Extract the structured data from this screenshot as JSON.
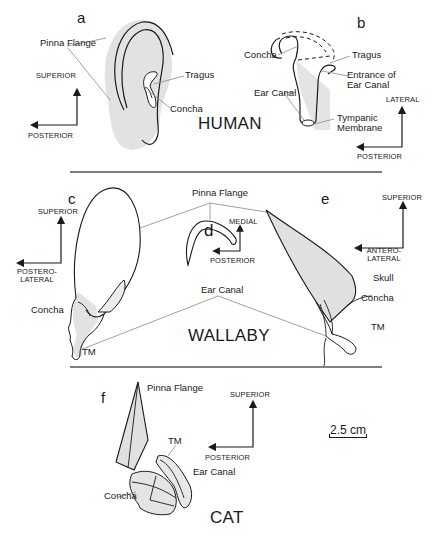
{
  "sections": {
    "human": {
      "species_label": "HUMAN",
      "panel_a": {
        "letter": "a",
        "labels": {
          "pinna_flange": "Pinna Flange",
          "tragus": "Tragus",
          "concha": "Concha"
        },
        "axes": {
          "up": "SUPERIOR",
          "left": "POSTERIOR"
        }
      },
      "panel_b": {
        "letter": "b",
        "labels": {
          "concha": "Concha",
          "tragus": "Tragus",
          "entrance_of_ear_canal": "Entrance of Ear Canal",
          "ear_canal": "Ear Canal",
          "tympanic_membrane": "Tympanic Membrane"
        },
        "axes": {
          "up": "LATERAL",
          "left": "POSTERIOR"
        }
      }
    },
    "wallaby": {
      "species_label": "WALLABY",
      "shared_labels": {
        "pinna_flange": "Pinna Flange",
        "ear_canal": "Ear Canal"
      },
      "panel_c": {
        "letter": "c",
        "labels": {
          "concha": "Concha",
          "tm": "TM"
        },
        "axes": {
          "up": "SUPERIOR",
          "left": "POSTERO-LATERAL"
        }
      },
      "panel_d": {
        "letter": "d",
        "axes": {
          "up": "MEDIAL",
          "left": "POSTERIOR"
        }
      },
      "panel_e": {
        "letter": "e",
        "labels": {
          "skull": "Skull",
          "concha": "Concha",
          "tm": "TM"
        },
        "axes": {
          "up": "SUPERIOR",
          "left": "ANTERO-LATERAL"
        }
      }
    },
    "cat": {
      "species_label": "CAT",
      "panel_f": {
        "letter": "f",
        "labels": {
          "pinna_flange": "Pinna Flange",
          "tm": "TM",
          "ear_canal": "Ear Canal",
          "concha": "Concha"
        },
        "axes": {
          "up": "SUPERIOR",
          "left": "POSTERIOR"
        }
      }
    }
  },
  "scale_bar": {
    "label": "2.5 cm"
  },
  "colors": {
    "line": "#1a1a1a",
    "leader": "#8a8a8a",
    "shade": "#dcdcdc",
    "divider": "#555555"
  }
}
